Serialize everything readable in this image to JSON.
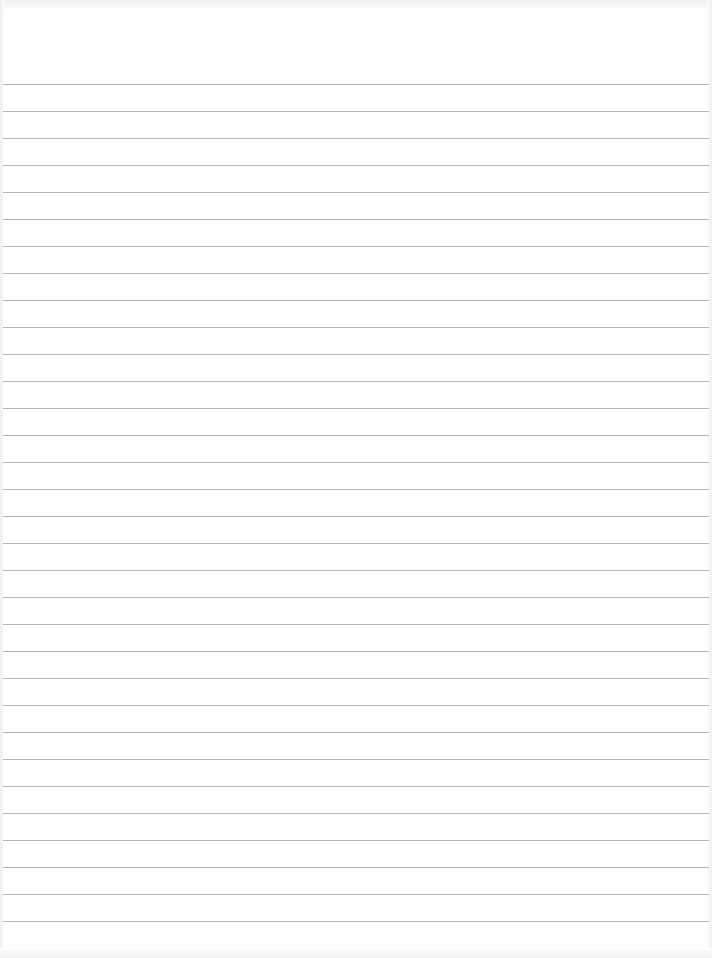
{
  "document": {
    "type": "lined-paper",
    "text": "",
    "rules": {
      "count": 32,
      "first_y": 84,
      "spacing": 27,
      "color": "#a9a9a9"
    },
    "background_color": "#fefefe"
  }
}
